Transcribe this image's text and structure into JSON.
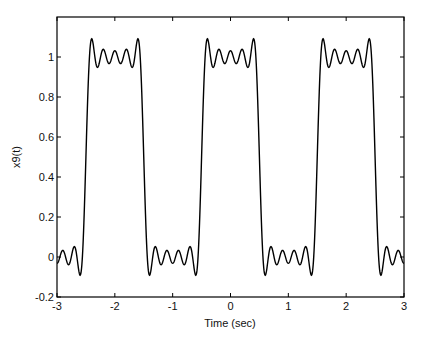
{
  "chart_data": {
    "type": "line",
    "title": "",
    "xlabel": "Time (sec)",
    "ylabel": "x9(t)",
    "xlim": [
      -3,
      3
    ],
    "ylim": [
      -0.2,
      1.2
    ],
    "xticks": [
      -3,
      -2,
      -1,
      0,
      1,
      2,
      3
    ],
    "xtick_labels": [
      "-3",
      "-2",
      "-1",
      "0",
      "1",
      "2",
      "3"
    ],
    "yticks": [
      -0.2,
      0,
      0.2,
      0.4,
      0.6,
      0.8,
      1
    ],
    "ytick_labels": [
      "-0.2",
      "0",
      "0.2",
      "0.4",
      "0.6",
      "0.8",
      "1"
    ],
    "grid": false,
    "legend": null,
    "line_color": "#000000",
    "series": [
      {
        "name": "x9(t)",
        "formula": "0.5 + sum_{k=1..9} (2/(k*pi)) * sin(k*pi/2) * cos(k*pi*t)",
        "period": 2,
        "max_harmonic": 9,
        "x": [
          -3,
          -2.75,
          -2.5,
          -2.42,
          -2.25,
          -2,
          -1.75,
          -1.58,
          -1.5,
          -1.42,
          -1.25,
          -1,
          -0.75,
          -0.58,
          -0.5,
          -0.42,
          -0.25,
          0,
          0.25,
          0.42,
          0.5,
          0.58,
          0.75,
          1,
          1.25,
          1.42,
          1.5,
          1.58,
          1.75,
          2,
          2.25,
          2.42,
          2.5,
          2.58,
          2.75,
          3
        ],
        "y": [
          0.03,
          0.03,
          0.5,
          1.09,
          0.97,
          1.03,
          0.97,
          1.09,
          0.5,
          -0.09,
          0.03,
          -0.03,
          0.03,
          -0.09,
          0.5,
          1.09,
          0.97,
          1.03,
          0.97,
          1.09,
          0.5,
          -0.09,
          0.03,
          -0.03,
          0.03,
          -0.09,
          0.5,
          1.09,
          0.97,
          1.03,
          0.97,
          1.09,
          0.5,
          -0.09,
          0.03,
          -0.03
        ]
      }
    ]
  }
}
